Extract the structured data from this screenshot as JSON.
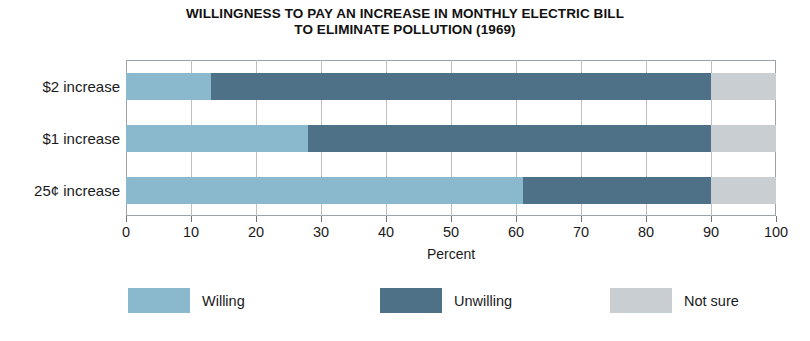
{
  "chart_data": {
    "type": "bar",
    "orientation": "horizontal",
    "stacked": true,
    "title_lines": [
      "WILLINGNESS TO PAY AN INCREASE IN MONTHLY ELECTRIC BILL",
      "TO ELIMINATE POLLUTION (1969)"
    ],
    "title": "WILLINGNESS TO PAY AN INCREASE IN MONTHLY ELECTRIC BILL TO ELIMINATE POLLUTION (1969)",
    "xlabel": "Percent",
    "ylabel": "",
    "xlim": [
      0,
      100
    ],
    "xticks": [
      0,
      10,
      20,
      30,
      40,
      50,
      60,
      70,
      80,
      90,
      100
    ],
    "xticklabels": [
      "0",
      "10",
      "20",
      "30",
      "40",
      "50",
      "60",
      "70",
      "80",
      "90",
      "100"
    ],
    "grid": "vertical",
    "legend_position": "bottom",
    "categories": [
      "$2 increase",
      "$1 increase",
      "25¢ increase"
    ],
    "series": [
      {
        "name": "Willing",
        "color": "#8ab8cc",
        "values": [
          13,
          28,
          61
        ]
      },
      {
        "name": "Unwilling",
        "color": "#4e7187",
        "values": [
          77,
          62,
          29
        ]
      },
      {
        "name": "Not sure",
        "color": "#c8ced1",
        "values": [
          10,
          10,
          10
        ]
      }
    ]
  },
  "colors": {
    "willing": "#8ab8cc",
    "unwilling": "#4e7187",
    "not_sure": "#c8ced1",
    "frame": "#9aa3a8",
    "gridline": "#b9c1c6",
    "text": "#1a1a1a",
    "background": "#ffffff"
  }
}
